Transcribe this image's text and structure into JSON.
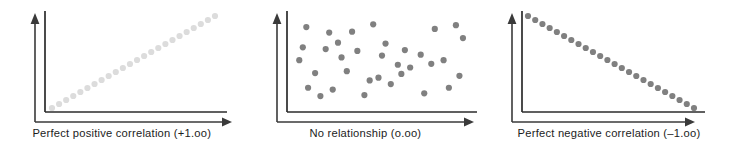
{
  "figure": {
    "background_color": "#ffffff",
    "width": 731,
    "height": 150
  },
  "style": {
    "axis_color": "#3a3a3a",
    "frame_color": "#2b2b2b",
    "caption_color": "#1c1c1c",
    "dot_color_light": "#dcdcdc",
    "dot_color_dark": "#808080"
  },
  "panels": [
    {
      "id": "panel-positive",
      "caption": "Perfect positive correlation (+1.oo)",
      "correlation_value": "+1.oo",
      "relationship": "Perfect positive correlation",
      "dot_color": "#dcdcdc",
      "dot_radius": 3.1
    },
    {
      "id": "panel-none",
      "caption": "No relationship (o.oo)",
      "correlation_value": "o.oo",
      "relationship": "No relationship",
      "dot_color": "#808080",
      "dot_radius": 3.1
    },
    {
      "id": "panel-negative",
      "caption": "Perfect negative correlation (–1.oo)",
      "correlation_value": "–1.oo",
      "relationship": "Perfect negative correlation",
      "dot_color": "#808080",
      "dot_radius": 3.1
    }
  ],
  "chart_data": [
    {
      "type": "scatter",
      "title": "Perfect positive correlation (+1.oo)",
      "xlabel": "",
      "ylabel": "",
      "correlation": 1.0,
      "xlim": [
        0,
        100
      ],
      "ylim": [
        0,
        100
      ],
      "grid": false,
      "legend": "none",
      "series": [
        {
          "name": "perfect positive",
          "color": "#dcdcdc",
          "x": [
            0,
            4.35,
            8.7,
            13.04,
            17.39,
            21.74,
            26.09,
            30.43,
            34.78,
            39.13,
            43.48,
            47.83,
            52.17,
            56.52,
            60.87,
            65.22,
            69.57,
            73.91,
            78.26,
            82.61,
            86.96,
            91.3,
            95.65,
            100
          ],
          "y": [
            0,
            4.35,
            8.7,
            13.04,
            17.39,
            21.74,
            26.09,
            30.43,
            34.78,
            39.13,
            43.48,
            47.83,
            52.17,
            56.52,
            60.87,
            65.22,
            69.57,
            73.91,
            78.26,
            82.61,
            86.96,
            91.3,
            95.65,
            100
          ]
        }
      ]
    },
    {
      "type": "scatter",
      "title": "No relationship (o.oo)",
      "xlabel": "",
      "ylabel": "",
      "correlation": 0.0,
      "xlim": [
        0,
        100
      ],
      "ylim": [
        0,
        100
      ],
      "grid": false,
      "legend": "none",
      "series": [
        {
          "name": "no relationship",
          "color": "#808080",
          "x": [
            7,
            20,
            33,
            45,
            5,
            18,
            36,
            3,
            27,
            52,
            63,
            72,
            59,
            80,
            92,
            12,
            30,
            48,
            66,
            85,
            96,
            8,
            22,
            40,
            55,
            74,
            88,
            15,
            43,
            61,
            78,
            94,
            25,
            50
          ],
          "y": [
            88,
            82,
            83,
            91,
            66,
            64,
            62,
            52,
            55,
            70,
            63,
            58,
            47,
            86,
            90,
            38,
            40,
            33,
            44,
            52,
            76,
            22,
            20,
            14,
            26,
            16,
            22,
            13,
            30,
            37,
            48,
            35,
            71,
            57
          ]
        }
      ]
    },
    {
      "type": "scatter",
      "title": "Perfect negative correlation (–1.oo)",
      "xlabel": "",
      "ylabel": "",
      "correlation": -1.0,
      "xlim": [
        0,
        100
      ],
      "ylim": [
        0,
        100
      ],
      "grid": false,
      "legend": "none",
      "series": [
        {
          "name": "perfect negative",
          "color": "#808080",
          "x": [
            0,
            4.35,
            8.7,
            13.04,
            17.39,
            21.74,
            26.09,
            30.43,
            34.78,
            39.13,
            43.48,
            47.83,
            52.17,
            56.52,
            60.87,
            65.22,
            69.57,
            73.91,
            78.26,
            82.61,
            86.96,
            91.3,
            95.65,
            100
          ],
          "y": [
            100,
            95.65,
            91.3,
            86.96,
            82.61,
            78.26,
            73.91,
            69.57,
            65.22,
            60.87,
            56.52,
            52.17,
            47.83,
            43.48,
            39.13,
            34.78,
            30.43,
            26.09,
            21.74,
            17.39,
            13.04,
            8.7,
            4.35,
            0
          ]
        }
      ]
    }
  ]
}
